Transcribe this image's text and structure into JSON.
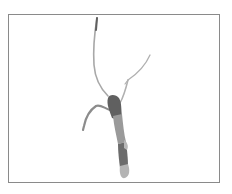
{
  "image": {
    "subject": "branched tubular specimen (root / vessel cast) on white background",
    "frame_color": "#8a8a8a",
    "background_color": "#ffffff",
    "colors": {
      "dark_segment": "#606060",
      "mid_segment": "#8c8c8c",
      "light_segment": "#b4b4b4",
      "thin_branch": "#a8a8a8"
    }
  }
}
